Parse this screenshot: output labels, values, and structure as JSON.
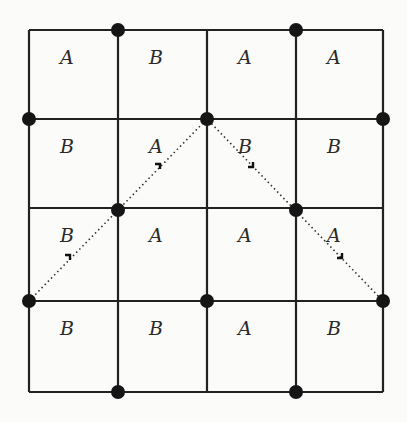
{
  "figure": {
    "grid": {
      "cols": 4,
      "rows": 4,
      "x_lines": [
        29,
        118,
        207,
        296,
        383
      ],
      "y_lines": [
        30,
        119,
        208,
        301,
        392
      ],
      "line_color": "#222222"
    },
    "cells": [
      [
        "A",
        "B",
        "A",
        "A"
      ],
      [
        "B",
        "A",
        "B",
        "B"
      ],
      [
        "B",
        "A",
        "A",
        "A"
      ],
      [
        "B",
        "B",
        "A",
        "B"
      ]
    ],
    "dots": [
      [
        118,
        30
      ],
      [
        296,
        30
      ],
      [
        29,
        119
      ],
      [
        207,
        119
      ],
      [
        383,
        119
      ],
      [
        118,
        210
      ],
      [
        296,
        210
      ],
      [
        29,
        301
      ],
      [
        207,
        301
      ],
      [
        383,
        301
      ],
      [
        118,
        392
      ],
      [
        296,
        392
      ]
    ],
    "dotted_path": [
      [
        29,
        301
      ],
      [
        207,
        119
      ],
      [
        383,
        301
      ]
    ],
    "arrow_markers": [
      {
        "x": 70,
        "y": 259,
        "dir": "up-right"
      },
      {
        "x": 160,
        "y": 168,
        "dir": "up-right"
      },
      {
        "x": 253,
        "y": 167,
        "dir": "down-right"
      },
      {
        "x": 342,
        "y": 258,
        "dir": "down-right"
      }
    ]
  }
}
